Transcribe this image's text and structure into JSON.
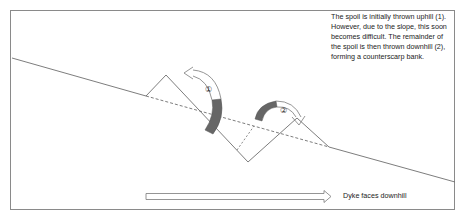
{
  "diagram": {
    "note_text": "The spoil is initially thrown uphill (1).  However, due to the slope, this soon becomes difficult.  The remainder of the spoil is then thrown downhill (2), forming a counterscarp bank.",
    "arrow_labels": {
      "first": "①",
      "second": "②"
    },
    "direction_caption": "Dyke faces downhill",
    "colors": {
      "line": "#6e6e6e",
      "spoil_band": "#666666",
      "frame": "#8a8a8a"
    }
  }
}
